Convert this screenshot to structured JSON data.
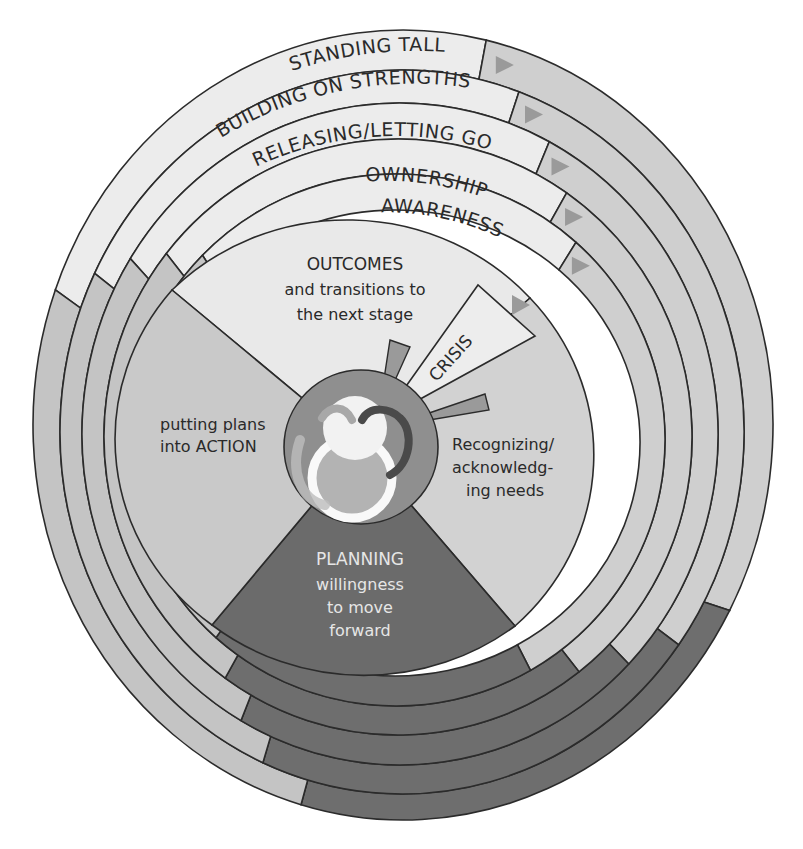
{
  "diagram": {
    "type": "concentric-spiral-cycle",
    "colors": {
      "background": "#ffffff",
      "stroke": "#2b2b2b",
      "label_band": "#ececec",
      "light_gray": "#cfcfcf",
      "mid_gray": "#c4c4c4",
      "dark_gray": "#6e6e6e",
      "hub": "#8f8f8f",
      "triangle": "#9a9a9a",
      "outcomes_sector": "#e9e9e9",
      "recognizing_sector": "#d2d2d2",
      "action_sector": "#c9c9c9",
      "planning_sector": "#6b6b6b"
    },
    "rings": [
      {
        "id": "standing-tall",
        "label": "STANDING TALL",
        "level": 5
      },
      {
        "id": "building-on-strengths",
        "label": "BUILDING ON STRENGTHS",
        "level": 4
      },
      {
        "id": "releasing-letting-go",
        "label": "RELEASING/LETTING GO",
        "level": 3
      },
      {
        "id": "ownership",
        "label": "OWNERSHIP",
        "level": 2
      },
      {
        "id": "awareness",
        "label": "AWARENESS",
        "level": 1
      }
    ],
    "sectors": {
      "outcomes": {
        "title": "OUTCOMES",
        "lines": [
          "and transitions to",
          "the next stage"
        ]
      },
      "crisis": {
        "title": "CRISIS"
      },
      "recognizing": {
        "lines": [
          "Recognizing/",
          "acknowledg-",
          "ing needs"
        ]
      },
      "planning": {
        "title": "PLANNING",
        "lines": [
          "willingness",
          "to move",
          "forward"
        ]
      },
      "action": {
        "lines": [
          "putting plans",
          "into ACTION"
        ]
      }
    },
    "center": {
      "icon": "interlocking-rings-knot-icon"
    }
  }
}
